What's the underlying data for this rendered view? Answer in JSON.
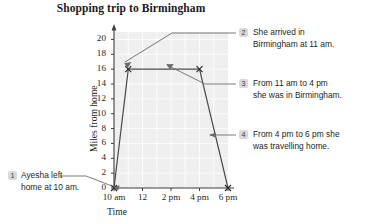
{
  "chart_data": {
    "type": "line",
    "title": "Shopping trip to Birmingham",
    "xlabel": "Time",
    "ylabel": "Miles from home",
    "grid": true,
    "legend": "none",
    "x_tick_labels": [
      "10 am",
      "12",
      "2 pm",
      "4 pm",
      "6 pm"
    ],
    "x_tick_values": [
      10,
      12,
      14,
      16,
      18
    ],
    "xlim": [
      10,
      18
    ],
    "y_tick_labels": [
      "0",
      "2",
      "4",
      "6",
      "8",
      "10",
      "12",
      "14",
      "16",
      "18",
      "20"
    ],
    "y_tick_values": [
      0,
      2,
      4,
      6,
      8,
      10,
      12,
      14,
      16,
      18,
      20
    ],
    "ylim": [
      0,
      21
    ],
    "series": [
      {
        "name": "Distance from home",
        "points": [
          {
            "x": 10,
            "x_label": "10 am",
            "y": 0
          },
          {
            "x": 11,
            "x_label": "11 am",
            "y": 16
          },
          {
            "x": 16,
            "x_label": "4 pm",
            "y": 16
          },
          {
            "x": 18,
            "x_label": "6 pm",
            "y": 0
          }
        ],
        "marker": "x"
      }
    ],
    "annotations": [
      {
        "number": "1",
        "text_lines": [
          "Ayesha left",
          "home at 10 am."
        ],
        "target": {
          "x": 10,
          "y": 0
        }
      },
      {
        "number": "2",
        "text_lines": [
          "She arrived in",
          "Birmingham at 11 am."
        ],
        "target": {
          "x": 11,
          "y": 16
        }
      },
      {
        "number": "3",
        "text_lines": [
          "From 11 am to 4 pm",
          "she was in Birmingham."
        ],
        "target": {
          "x": 14,
          "y": 16
        }
      },
      {
        "number": "4",
        "text_lines": [
          "From 4 pm to 6 pm she",
          "was travelling home."
        ],
        "target": {
          "x": 17,
          "y": 8
        }
      }
    ]
  },
  "colors": {
    "plot_background": "#efefef",
    "gridline": "#ffffff",
    "axis": "#3c3c3c",
    "data_line": "#4a4a4a",
    "badge_background": "#d9d9d9",
    "text": "#231f20"
  }
}
